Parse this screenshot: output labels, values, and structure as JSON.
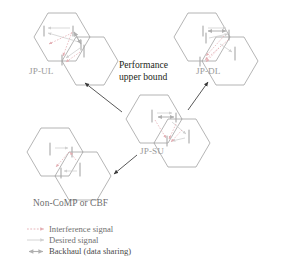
{
  "figure": {
    "title_annotation": {
      "line1": "Performance",
      "line2": "upper bound"
    },
    "background_color": "#ffffff",
    "colors": {
      "hexagon_stroke": "#8c8c8c",
      "interference_arrow": "#e8b4b8",
      "desired_arrow": "#d9d9d9",
      "backhaul_arrow": "#b5b5b5",
      "transition_arrow": "#3a3a3a",
      "label_gray": "#9a9a9a",
      "text_dark": "#231f20"
    }
  },
  "clusters": [
    {
      "id": "jp-ul",
      "label": "JP-UL",
      "label_x": 29,
      "label_y": 68
    },
    {
      "id": "jp-dl",
      "label": "JP-DL",
      "label_x": 196,
      "label_y": 68
    },
    {
      "id": "jp-su",
      "label": "JP-SU",
      "label_x": 140,
      "label_y": 148
    },
    {
      "id": "non-comp",
      "label": "Non-CoMP or CBF",
      "label_x": 33,
      "label_y": 200
    }
  ],
  "legend": {
    "items": [
      {
        "id": "interference",
        "label": "Interference signal",
        "arrow_style": "dashed-single",
        "color": "#e8b4b8"
      },
      {
        "id": "desired",
        "label": "Desired signal",
        "arrow_style": "solid-single",
        "color": "#d0d0d0"
      },
      {
        "id": "backhaul",
        "label": "Backhaul (data sharing)",
        "arrow_style": "solid-double",
        "color": "#b0b0b0"
      }
    ]
  },
  "transition_arrows": [
    {
      "id": "su-to-ul",
      "from": "jp-su",
      "to": "jp-ul"
    },
    {
      "id": "su-to-dl",
      "from": "jp-su",
      "to": "jp-dl"
    },
    {
      "id": "su-to-noncomp",
      "from": "jp-su",
      "to": "non-comp"
    }
  ]
}
